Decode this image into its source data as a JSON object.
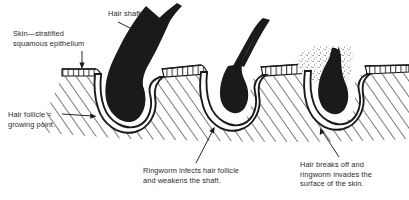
{
  "figure": {
    "background_color": "#ffffff",
    "ink_color": "#1a1a1a",
    "text_color": "#2b2b2b"
  },
  "labels": {
    "skin": "Skin—stratified\nsquamous epithelium",
    "hair_shaft": "Hair shaft",
    "hair_follicle": "Hair follicle =\ngrowing point.",
    "ringworm_infects": "Ringworm infects hair follicle\nand weakens the shaft.",
    "hair_breaks": "Hair breaks off and\nringworm invades the\nsurface of the skin."
  },
  "structures": {
    "epithelium_name": "stratified-squamous-epithelium-band",
    "dermis_name": "dermis-hatching",
    "follicles": [
      {
        "id": "follicle-healthy",
        "state": "healthy",
        "hair": "thick-curved-hair-shaft",
        "label_ref": "hair_follicle"
      },
      {
        "id": "follicle-infected",
        "state": "infected-weakened",
        "hair": "thin-tapering-hair-shaft",
        "label_ref": "ringworm_infects"
      },
      {
        "id": "follicle-broken",
        "state": "hair-broken-off-ringworm-on-surface",
        "hair": "stub-broken-hair-shaft",
        "label_ref": "hair_breaks"
      }
    ]
  },
  "annotations": {
    "pointers": [
      {
        "name": "pointer-skin-to-epithelium",
        "from": "skin-label",
        "to": "epithelium-band"
      },
      {
        "name": "pointer-hair-shaft",
        "from": "hair-shaft-label",
        "to": "first-hair-shaft"
      },
      {
        "name": "pointer-follicle",
        "from": "hair-follicle-label",
        "to": "first-follicle-bulb"
      },
      {
        "name": "pointer-ringworm-infects",
        "from": "ringworm-infects-label",
        "to": "second-follicle-bulb"
      },
      {
        "name": "pointer-hair-breaks",
        "from": "hair-breaks-label",
        "to": "third-follicle-bulb"
      }
    ]
  }
}
